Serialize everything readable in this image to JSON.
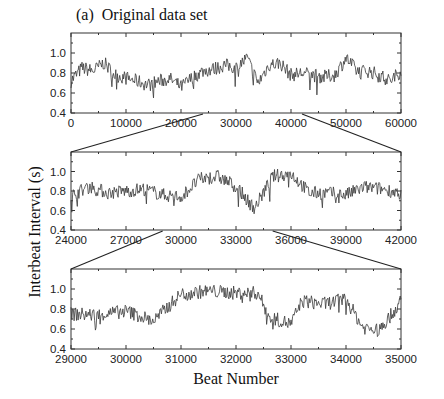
{
  "figure": {
    "panel_title": "(a)  Original data set",
    "ylabel": "Interbeat Interval (s)",
    "xlabel": "Beat Number"
  },
  "chart_data": [
    {
      "type": "line",
      "title": "(a) Original data set",
      "xlabel": "",
      "ylabel": "Interbeat Interval (s)",
      "xlim": [
        0,
        60000
      ],
      "ylim": [
        0.4,
        1.2
      ],
      "xticks": [
        "0",
        "10000",
        "20000",
        "30000",
        "40000",
        "50000",
        "60000"
      ],
      "yticks": [
        "0.4",
        "0.6",
        "0.8",
        "1.0"
      ],
      "grid": false,
      "series": [
        {
          "name": "interbeat interval",
          "x": [
            0,
            2000,
            4000,
            6000,
            8000,
            10000,
            12000,
            14000,
            16000,
            18000,
            20000,
            22000,
            24000,
            26000,
            28000,
            30000,
            32000,
            34000,
            36000,
            38000,
            40000,
            42000,
            44000,
            46000,
            48000,
            50000,
            52000,
            54000,
            56000,
            58000,
            60000
          ],
          "values": [
            0.72,
            0.85,
            0.82,
            0.9,
            0.78,
            0.75,
            0.72,
            0.68,
            0.72,
            0.74,
            0.66,
            0.75,
            0.82,
            0.84,
            0.88,
            0.85,
            0.95,
            0.7,
            0.88,
            0.9,
            0.78,
            0.8,
            0.78,
            0.76,
            0.78,
            0.95,
            0.82,
            0.82,
            0.78,
            0.72,
            0.82
          ]
        }
      ]
    },
    {
      "type": "line",
      "title": "",
      "xlabel": "",
      "ylabel": "Interbeat Interval (s)",
      "xlim": [
        24000,
        42000
      ],
      "ylim": [
        0.4,
        1.2
      ],
      "xticks": [
        "24000",
        "27000",
        "30000",
        "33000",
        "36000",
        "39000",
        "42000"
      ],
      "yticks": [
        "0.4",
        "0.6",
        "0.8",
        "1.0"
      ],
      "grid": false,
      "series": [
        {
          "name": "interbeat interval",
          "x": [
            24000,
            25000,
            26000,
            27000,
            28000,
            29000,
            30000,
            31000,
            32000,
            33000,
            34000,
            35000,
            36000,
            37000,
            38000,
            39000,
            40000,
            41000,
            42000
          ],
          "values": [
            0.75,
            0.85,
            0.78,
            0.8,
            0.82,
            0.76,
            0.74,
            0.92,
            0.95,
            0.85,
            0.62,
            0.95,
            0.98,
            0.78,
            0.78,
            0.76,
            0.84,
            0.82,
            0.78
          ]
        }
      ]
    },
    {
      "type": "line",
      "title": "",
      "xlabel": "Beat Number",
      "ylabel": "Interbeat Interval (s)",
      "xlim": [
        29000,
        35000
      ],
      "ylim": [
        0.4,
        1.2
      ],
      "xticks": [
        "29000",
        "30000",
        "31000",
        "32000",
        "33000",
        "34000",
        "35000"
      ],
      "yticks": [
        "0.4",
        "0.6",
        "0.8",
        "1.0"
      ],
      "grid": false,
      "series": [
        {
          "name": "interbeat interval",
          "x": [
            29000,
            29500,
            30000,
            30500,
            31000,
            31500,
            32000,
            32400,
            32600,
            33000,
            33200,
            33600,
            34000,
            34300,
            34600,
            34900,
            35000
          ],
          "values": [
            0.75,
            0.74,
            0.78,
            0.68,
            0.95,
            0.98,
            0.96,
            0.96,
            0.72,
            0.65,
            0.88,
            0.85,
            0.9,
            0.62,
            0.58,
            0.8,
            0.88
          ]
        }
      ]
    }
  ]
}
